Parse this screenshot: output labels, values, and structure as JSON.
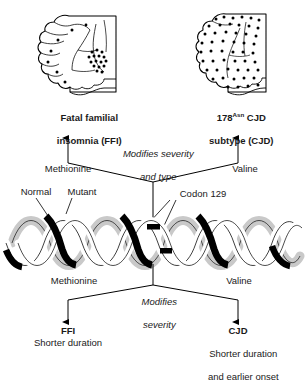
{
  "figure": {
    "title_semantic": "prion-disease-codon-129-modifier-diagram",
    "background_color": "#ffffff",
    "ink_color": "#000000",
    "helix_gray": "#d9d9d9",
    "helix_black": "#000000"
  },
  "top_panels": {
    "left": {
      "icon": "brain-sagittal-sparse-vacuolation-icon",
      "label_line1": "Fatal familial",
      "label_line2": "insomnia (FFI)",
      "dot_description": "sparse scattered dots with dense thalamic cluster"
    },
    "right": {
      "icon": "brain-sagittal-dense-vacuolation-icon",
      "label_prefix": "178",
      "label_superscript": "Asn",
      "label_suffix": " CJD",
      "label_line2": "subtype (CJD)",
      "dot_description": "dense dots distributed throughout cortex"
    }
  },
  "upper_branch": {
    "note_line1": "Modifies severity",
    "note_line2": "and type",
    "left_allele": "Methionine",
    "right_allele": "Valine"
  },
  "helix": {
    "label_normal": "Normal",
    "label_mutant": "Mutant",
    "label_codon": "Codon 129"
  },
  "lower_branch": {
    "note_line1": "Modifies",
    "note_line2": "severity",
    "left_allele": "Methionine",
    "right_allele": "Valine"
  },
  "bottom_panels": {
    "left": {
      "title": "FFI",
      "detail_line1": "Shorter duration",
      "detail_line2": ""
    },
    "right": {
      "title": "CJD",
      "detail_line1": "Shorter duration",
      "detail_line2": "and earlier onset"
    }
  }
}
